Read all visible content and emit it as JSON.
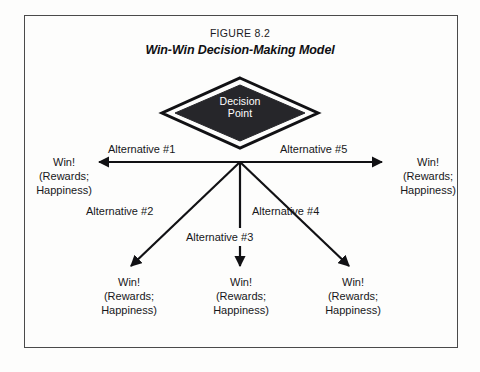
{
  "figure": {
    "number": "FIGURE 8.2",
    "title": "Win-Win Decision-Making Model"
  },
  "center_node": {
    "name": "decision-point",
    "line1": "Decision",
    "line2": "Point",
    "shape": "diamond",
    "fill_color": "#26262a",
    "text_color": "#ffffff",
    "outline_color": "#000000"
  },
  "branches": [
    {
      "id": "alternative-1",
      "label": "Alternative #1",
      "direction": "left",
      "outcome": {
        "line1": "Win!",
        "line2": "(Rewards;",
        "line3": "Happiness)"
      }
    },
    {
      "id": "alternative-2",
      "label": "Alternative #2",
      "direction": "down-left",
      "outcome": {
        "line1": "Win!",
        "line2": "(Rewards;",
        "line3": "Happiness)"
      }
    },
    {
      "id": "alternative-3",
      "label": "Alternative #3",
      "direction": "down",
      "outcome": {
        "line1": "Win!",
        "line2": "(Rewards;",
        "line3": "Happiness)"
      }
    },
    {
      "id": "alternative-4",
      "label": "Alternative #4",
      "direction": "down-right",
      "outcome": {
        "line1": "Win!",
        "line2": "(Rewards;",
        "line3": "Happiness)"
      }
    },
    {
      "id": "alternative-5",
      "label": "Alternative #5",
      "direction": "right",
      "outcome": {
        "line1": "Win!",
        "line2": "(Rewards;",
        "line3": "Happiness)"
      }
    }
  ],
  "colors": {
    "line": "#111114",
    "frame": "#4a4a4a",
    "background": "#fdfdfc",
    "text": "#17171a"
  }
}
